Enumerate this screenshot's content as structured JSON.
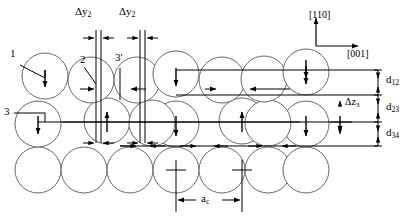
{
  "figure": {
    "type": "crystal-structure-schematic",
    "background_color": "#ffffff",
    "line_color": "#000000",
    "circle_fill": "#ffffff",
    "circle_stroke": "#555555"
  },
  "axes": {
    "vertical_label": "[110]",
    "horizontal_label": "[001]"
  },
  "lateral_shift_labels": [
    {
      "id": "dy2-left",
      "text_delta": "Δ",
      "text_var": "y",
      "sub": "2"
    },
    {
      "id": "dy2-right",
      "text_delta": "Δ",
      "text_var": "y",
      "sub": "2"
    }
  ],
  "lateral_shift_text": "Δy",
  "lateral_shift_sub": "2",
  "vertical_shift": {
    "delta": "Δ",
    "var": "z",
    "sub": "3"
  },
  "layer_spacings": [
    {
      "name": "d12",
      "delta": "d",
      "sub": "12"
    },
    {
      "name": "d23",
      "delta": "d",
      "sub": "23"
    },
    {
      "name": "d34",
      "delta": "d",
      "sub": "34"
    }
  ],
  "lattice_constant": {
    "var": "a",
    "sub": "c"
  },
  "atom_callouts": [
    {
      "id": "callout-1",
      "label": "1"
    },
    {
      "id": "callout-2",
      "label": "2"
    },
    {
      "id": "callout-3p",
      "label": "3'"
    },
    {
      "id": "callout-3",
      "label": "3"
    }
  ],
  "geometry": {
    "circle_radius": 23,
    "row_y": [
      74,
      122,
      170
    ],
    "reference_lines_y": [
      70,
      95,
      122,
      146
    ],
    "note": "three visible atomic rows of close-packed spheres with reference rulers on the right"
  }
}
